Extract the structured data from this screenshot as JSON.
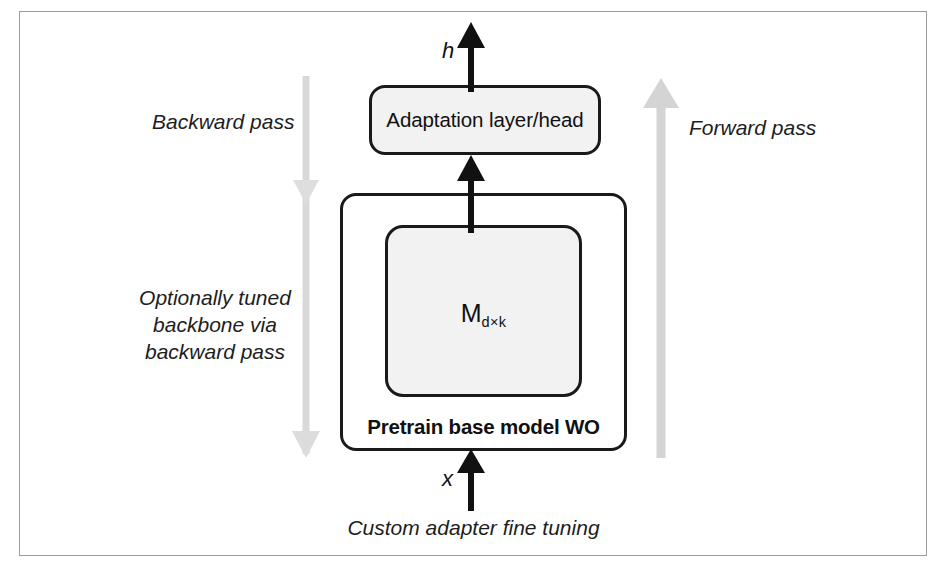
{
  "figure": {
    "caption": "Custom adapter fine tuning",
    "colors": {
      "box_stroke": "#1a1a1a",
      "box_fill": "#f2f2f2",
      "arrow_black": "#111111",
      "arrow_gray": "#d6d6d6",
      "frame": "#9b9b9b",
      "text": "#111111"
    }
  },
  "nodes": {
    "adaptation": {
      "label": "Adaptation layer/head"
    },
    "pretrain": {
      "label": "Pretrain base model WO"
    },
    "matrix": {
      "symbol": "M",
      "subscript": "d×k"
    }
  },
  "signals": {
    "output": {
      "label": "h"
    },
    "input": {
      "label": "x"
    }
  },
  "annotations": {
    "backward_pass": "Backward pass",
    "optionally_tuned": "Optionally tuned backbone via backward pass",
    "forward_pass": "Forward pass"
  },
  "icons": {
    "arrow_up_black": "arrow-up-icon",
    "arrow_down_gray": "arrow-down-icon",
    "arrow_up_gray": "arrow-up-icon"
  }
}
